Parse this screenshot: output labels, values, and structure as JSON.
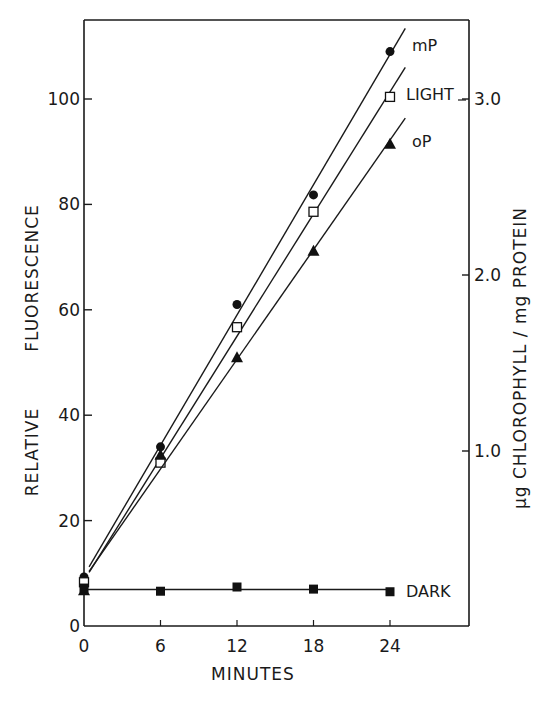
{
  "chart_data": {
    "type": "line",
    "title": "",
    "xlabel": "MINUTES",
    "ylabel": [
      "RELATIVE",
      "FLUORESCENCE"
    ],
    "ylabel_right": "µg CHLOROPHYLL / mg PROTEIN",
    "x": [
      0,
      6,
      12,
      18,
      24
    ],
    "x_ticks": [
      "0",
      "6",
      "12",
      "18",
      "24"
    ],
    "y_ticks": [
      "0",
      "20",
      "40",
      "60",
      "80",
      "100"
    ],
    "y_right_ticks": [
      "1.0",
      "2.0",
      "3.0"
    ],
    "xlim": [
      0,
      30
    ],
    "ylim": [
      0,
      115
    ],
    "y_right_lim": [
      0,
      3.4
    ],
    "grid": false,
    "legend": "inline labels at line ends",
    "series": [
      {
        "name": "mP",
        "marker": "filled-circle",
        "values": [
          9.3,
          34,
          61,
          81.8,
          109
        ]
      },
      {
        "name": "LIGHT",
        "marker": "open-square",
        "values": [
          8.3,
          31,
          56.7,
          78.6,
          100.4
        ]
      },
      {
        "name": "oP",
        "marker": "filled-triangle",
        "values": [
          6.8,
          32.5,
          51,
          71.2,
          91.5
        ]
      },
      {
        "name": "DARK",
        "marker": "filled-square",
        "values": [
          7.2,
          6.6,
          7.4,
          7.0,
          6.5
        ]
      }
    ]
  }
}
